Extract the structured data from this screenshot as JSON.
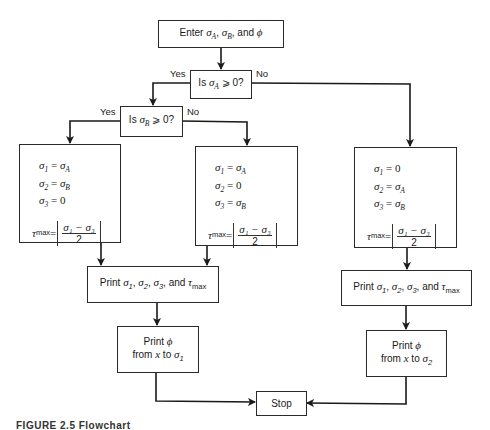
{
  "figure": {
    "caption": "FIGURE 2.5  Flowchart"
  },
  "start": {
    "text_prefix": "Enter ",
    "s1": "σ",
    "s1_sub": "A",
    "sep1": ", ",
    "s2": "σ",
    "s2_sub": "B",
    "sep2": ", and ",
    "s3": "ϕ"
  },
  "decision_a": {
    "prefix": "Is ",
    "sym": "σ",
    "sub": "A",
    "suffix": " ⩾ 0?",
    "yes_label": "Yes",
    "no_label": "No"
  },
  "decision_b": {
    "prefix": "Is ",
    "sym": "σ",
    "sub": "B",
    "suffix": " ⩾ 0?",
    "yes_label": "Yes",
    "no_label": "No"
  },
  "calc_boxes": [
    {
      "rows": [
        {
          "lhs": "σ",
          "lhs_sub": "1",
          "rhs": "σ",
          "rhs_sub": "A"
        },
        {
          "lhs": "σ",
          "lhs_sub": "2",
          "rhs": "σ",
          "rhs_sub": "B"
        },
        {
          "lhs": "σ",
          "lhs_sub": "3",
          "rhs": "0",
          "rhs_sub": ""
        }
      ],
      "tau": {
        "sym": "τ",
        "sub": "max",
        "eq": " = ",
        "num": "σ₁ − σ₃",
        "den": "2"
      }
    },
    {
      "rows": [
        {
          "lhs": "σ",
          "lhs_sub": "1",
          "rhs": "σ",
          "rhs_sub": "A"
        },
        {
          "lhs": "σ",
          "lhs_sub": "2",
          "rhs": "0",
          "rhs_sub": ""
        },
        {
          "lhs": "σ",
          "lhs_sub": "3",
          "rhs": "σ",
          "rhs_sub": "B"
        }
      ],
      "tau": {
        "sym": "τ",
        "sub": "max",
        "eq": " = ",
        "num": "σ₁ − σ₃",
        "den": "2"
      }
    },
    {
      "rows": [
        {
          "lhs": "σ",
          "lhs_sub": "1",
          "rhs": "0",
          "rhs_sub": ""
        },
        {
          "lhs": "σ",
          "lhs_sub": "2",
          "rhs": "σ",
          "rhs_sub": "A"
        },
        {
          "lhs": "σ",
          "lhs_sub": "3",
          "rhs": "σ",
          "rhs_sub": "B"
        }
      ],
      "tau": {
        "sym": "τ",
        "sub": "max",
        "eq": " = ",
        "num": "σ₁ − σ₃",
        "den": "2"
      }
    }
  ],
  "print_stress": {
    "prefix": "Print ",
    "a": "σ",
    "a_sub": "1",
    "sep1": ", ",
    "b": "σ",
    "b_sub": "2",
    "sep2": ", ",
    "c": "σ",
    "c_sub": "3",
    "sep3": ", and ",
    "d": "τ",
    "d_sub": "max"
  },
  "print_phi_left": {
    "line1_prefix": "Print ",
    "line1_sym": "ϕ",
    "line2_prefix": "from ",
    "x": "x",
    "to": " to ",
    "sym": "σ",
    "sub": "1"
  },
  "print_phi_right": {
    "line1_prefix": "Print ",
    "line1_sym": "ϕ",
    "line2_prefix": "from ",
    "x": "x",
    "to": " to ",
    "sym": "σ",
    "sub": "2"
  },
  "stop": {
    "label": "Stop"
  },
  "colors": {
    "line": "#1a1a1a",
    "background": "#ffffff"
  }
}
